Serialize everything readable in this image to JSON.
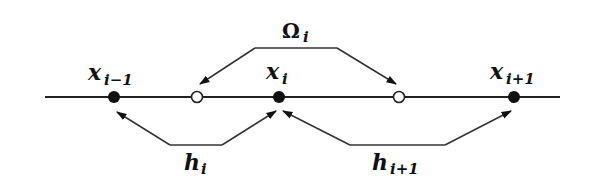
{
  "diagram": {
    "title": "",
    "axis_line": {
      "x1": 45,
      "x2": 560,
      "y": 97,
      "color": "#222222"
    },
    "nodes": [
      {
        "id": "x_im1",
        "kind": "grid-point",
        "filled": true,
        "x": 114,
        "y": 97,
        "label_base": "x",
        "label_sub": "i−1"
      },
      {
        "id": "mid_left",
        "kind": "midpoint",
        "filled": false,
        "x": 197,
        "y": 97
      },
      {
        "id": "x_i",
        "kind": "grid-point",
        "filled": true,
        "x": 279,
        "y": 97,
        "label_base": "x",
        "label_sub": "i"
      },
      {
        "id": "mid_right",
        "kind": "midpoint",
        "filled": false,
        "x": 399,
        "y": 97
      },
      {
        "id": "x_ip1",
        "kind": "grid-point",
        "filled": true,
        "x": 514,
        "y": 97,
        "label_base": "x",
        "label_sub": "i+1"
      }
    ],
    "annotations": [
      {
        "id": "omega",
        "label_base": "Ω",
        "label_sub": "i",
        "description": "control volume between midpoints",
        "points_to": [
          "mid_left",
          "mid_right"
        ]
      },
      {
        "id": "h_i",
        "label_base": "h",
        "label_sub": "i",
        "description": "spacing between x_{i-1} and x_i",
        "points_to": [
          "x_im1",
          "x_i"
        ]
      },
      {
        "id": "h_ip1",
        "label_base": "h",
        "label_sub": "i+1",
        "description": "spacing between x_i and x_{i+1}",
        "points_to": [
          "x_i",
          "x_ip1"
        ]
      }
    ],
    "colors": {
      "ink": "#111111",
      "background": "#ffffff"
    }
  },
  "labels": {
    "x_im1": {
      "base": "x",
      "sub": "i−1"
    },
    "x_i": {
      "base": "x",
      "sub": "i"
    },
    "x_ip1": {
      "base": "x",
      "sub": "i+1"
    },
    "omega": {
      "base": "Ω",
      "sub": "i"
    },
    "h_i": {
      "base": "h",
      "sub": "i"
    },
    "h_ip1": {
      "base": "h",
      "sub": "i+1"
    }
  }
}
